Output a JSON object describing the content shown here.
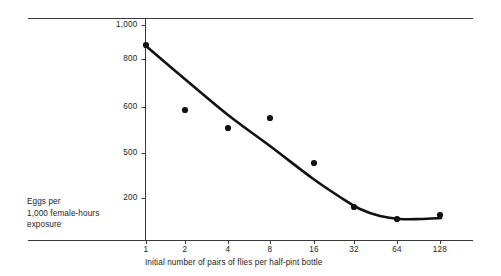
{
  "chart_data": {
    "type": "scatter",
    "title": "",
    "subtitle": "",
    "xlabel": "Initial number of pairs of flies per half-pint bottle",
    "ylabel": "Eggs per\n1,000 female-hours\nexposure",
    "x_scale": "log2",
    "x_ticks": [
      1,
      2,
      4,
      8,
      16,
      32,
      64,
      128
    ],
    "x_tick_labels": [
      "1",
      "2",
      "4",
      "8",
      "16",
      "32",
      "64",
      "128"
    ],
    "y_ticks": [
      200,
      500,
      600,
      800,
      1000
    ],
    "y_tick_labels": [
      "200",
      "500",
      "600",
      "800",
      "1,000"
    ],
    "y_tick_pixels": [
      198,
      153,
      107,
      59,
      25
    ],
    "grid": false,
    "legend": false,
    "x": [
      1,
      2,
      4,
      8,
      16,
      32,
      64,
      128
    ],
    "values": [
      880,
      592,
      553,
      575,
      455,
      150,
      90,
      105
    ],
    "series": [
      {
        "name": "Eggs per 1,000 female-hours exposure",
        "marker": "filled-circle",
        "marker_color": "#111111",
        "values": [
          880,
          592,
          553,
          575,
          455,
          150,
          90,
          105
        ],
        "point_pixels": [
          [
            146,
            45
          ],
          [
            185,
            110
          ],
          [
            228,
            128
          ],
          [
            270,
            118
          ],
          [
            314,
            163
          ],
          [
            354,
            207
          ],
          [
            397,
            219
          ],
          [
            440,
            215
          ]
        ]
      },
      {
        "name": "fitted curve",
        "type": "line",
        "line_color": "#111111",
        "curve_pixels": [
          [
            146,
            46
          ],
          [
            186,
            80
          ],
          [
            228,
            115
          ],
          [
            270,
            146
          ],
          [
            312,
            178
          ],
          [
            340,
            197
          ],
          [
            360,
            209
          ],
          [
            380,
            216
          ],
          [
            400,
            219
          ],
          [
            420,
            219
          ],
          [
            441,
            218
          ]
        ]
      }
    ],
    "annotations": []
  },
  "axes": {
    "y_caption": "Eggs per\n1,000 female-hours\nexposure",
    "x_caption": "Initial number of pairs of flies per half-pint bottle"
  },
  "colors": {
    "ink": "#1a1a1a",
    "rule": "#3a3a3a",
    "marker": "#111111",
    "background": "#ffffff"
  }
}
